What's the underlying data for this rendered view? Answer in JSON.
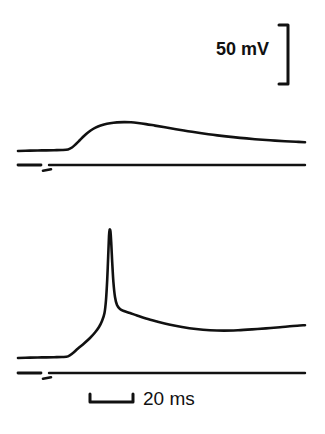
{
  "figure": {
    "background_color": "#ffffff",
    "ink_color": "#111111",
    "width": 325,
    "height": 434
  },
  "scale_bars": {
    "vertical": {
      "label": "50 mV",
      "value": 50,
      "unit": "mV",
      "orientation": "vertical",
      "bracket_style": "right-bracket",
      "x": 288,
      "y_top": 25,
      "y_bottom": 84,
      "pixel_length": 59
    },
    "horizontal": {
      "label": "20 ms",
      "value": 20,
      "unit": "ms",
      "orientation": "horizontal",
      "bracket_style": "u-bracket",
      "y": 402,
      "x_left": 90,
      "x_right": 133,
      "pixel_length": 43
    }
  },
  "chart_data": {
    "type": "line",
    "title": "",
    "xlabel": "",
    "ylabel": "",
    "grid": false,
    "legend": null,
    "axes_visible": false,
    "x_units": "ms",
    "y_units": "mV",
    "pixels_per_ms": 2.15,
    "pixels_per_mV": 1.18,
    "panels": [
      {
        "name": "upper-trace-subthreshold",
        "description": "Subthreshold depolarizing response (EPSP-like): flat baseline, slow rise to a rounded peak, slow decay.",
        "baseline_y_px": 150,
        "peak_y_px": 122,
        "peak_amplitude_mV": 24,
        "onset_x_px": 68,
        "peak_x_px": 120,
        "trace_points_px": [
          [
            18,
            151
          ],
          [
            30,
            150.6
          ],
          [
            42,
            150.4
          ],
          [
            54,
            150.2
          ],
          [
            62,
            150
          ],
          [
            68,
            149.4
          ],
          [
            72,
            147.5
          ],
          [
            76,
            144
          ],
          [
            80,
            140
          ],
          [
            84,
            136
          ],
          [
            88,
            132.5
          ],
          [
            93,
            129
          ],
          [
            98,
            126.5
          ],
          [
            104,
            124.6
          ],
          [
            110,
            123.3
          ],
          [
            117,
            122.4
          ],
          [
            124,
            122.1
          ],
          [
            131,
            122.3
          ],
          [
            138,
            123
          ],
          [
            146,
            124.1
          ],
          [
            155,
            125.6
          ],
          [
            165,
            127.3
          ],
          [
            176,
            129.2
          ],
          [
            188,
            131.2
          ],
          [
            200,
            133
          ],
          [
            213,
            134.8
          ],
          [
            226,
            136.4
          ],
          [
            240,
            137.9
          ],
          [
            255,
            139.2
          ],
          [
            270,
            140.3
          ],
          [
            285,
            141.2
          ],
          [
            296,
            141.8
          ],
          [
            305,
            142.2
          ]
        ],
        "reference_line": {
          "y_px": 165,
          "x_start": 18,
          "x_end": 305,
          "gap_x_start": 41,
          "gap_x_end": 49,
          "stimulus_tick": {
            "x_start": 43,
            "x_end": 51,
            "y_px": 170
          }
        }
      },
      {
        "name": "lower-trace-action-potential",
        "description": "Suprathreshold response: baseline, slow depolarizing ramp to threshold, fast full-height action potential spike, rapid repolarization then slow after-depolarization decay.",
        "baseline_y_px": 357,
        "spike_peak_y_px": 230,
        "spike_peak_x_px": 109,
        "spike_amplitude_mV": 107,
        "onset_x_px": 68,
        "trace_points_px": [
          [
            18,
            358
          ],
          [
            30,
            357.6
          ],
          [
            42,
            357.4
          ],
          [
            54,
            357.2
          ],
          [
            62,
            357
          ],
          [
            68,
            356.4
          ],
          [
            73,
            353
          ],
          [
            78,
            348.5
          ],
          [
            84,
            343.5
          ],
          [
            90,
            338
          ],
          [
            95,
            332.5
          ],
          [
            99,
            327
          ],
          [
            102,
            321
          ],
          [
            104.5,
            313
          ],
          [
            106,
            300
          ],
          [
            107.2,
            280
          ],
          [
            108.2,
            256
          ],
          [
            109,
            236
          ],
          [
            109.6,
            230
          ],
          [
            110.4,
            231
          ],
          [
            111.2,
            242
          ],
          [
            112.2,
            262
          ],
          [
            113.4,
            282
          ],
          [
            115,
            297
          ],
          [
            117,
            305
          ],
          [
            120,
            309
          ],
          [
            124,
            311
          ],
          [
            130,
            313
          ],
          [
            137,
            315.5
          ],
          [
            146,
            318.5
          ],
          [
            157,
            321.5
          ],
          [
            169,
            324.5
          ],
          [
            182,
            327
          ],
          [
            196,
            329
          ],
          [
            210,
            330.2
          ],
          [
            224,
            330.6
          ],
          [
            238,
            330.2
          ],
          [
            252,
            329.4
          ],
          [
            266,
            328.4
          ],
          [
            280,
            327.2
          ],
          [
            293,
            326
          ],
          [
            305,
            325.2
          ]
        ],
        "reference_line": {
          "y_px": 373,
          "x_start": 18,
          "x_end": 305,
          "gap_x_start": 41,
          "gap_x_end": 49,
          "stimulus_tick": {
            "x_start": 43,
            "x_end": 51,
            "y_px": 378
          }
        }
      }
    ]
  }
}
